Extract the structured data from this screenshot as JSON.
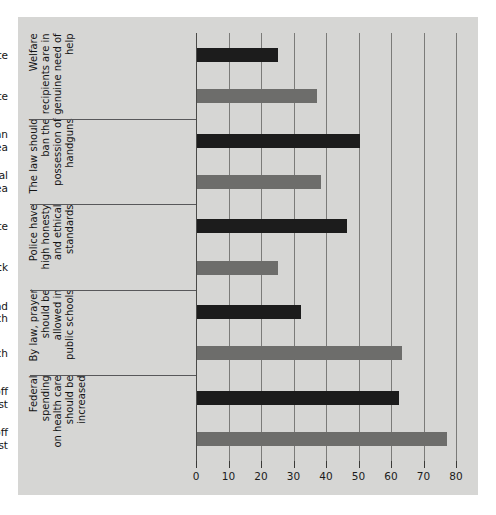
{
  "chart_data": {
    "type": "bar",
    "orientation": "horizontal",
    "title": "",
    "xlabel": "",
    "ylabel": "",
    "xlim": [
      0,
      80
    ],
    "xticks": [
      0,
      10,
      20,
      30,
      40,
      50,
      60,
      70,
      80
    ],
    "xticklabels": [
      "0",
      "10",
      "20",
      "30",
      "40",
      "50",
      "60",
      "70",
      "80"
    ],
    "grid": true,
    "grid_axis": "x",
    "legend": null,
    "colors": {
      "dark_bar": "#1c1c1c",
      "light_bar": "#6d6d6b",
      "panel_background": "#d6d6d4",
      "gridline": "#7b7b79",
      "separator": "#58585a",
      "text": "#141414"
    },
    "groups": [
      {
        "group_label": "Welfare\nrecipients are in\ngenuine need of\nhelp",
        "bars": [
          {
            "category": "Respondent is white",
            "value": 25,
            "style": "dark"
          },
          {
            "category": "Respondent is nonwhite",
            "value": 37,
            "style": "light"
          }
        ]
      },
      {
        "group_label": "The law should\nban the\npossession of\nhandguns",
        "bars": [
          {
            "category": "Respondent lives in an urban area",
            "value": 50,
            "style": "dark"
          },
          {
            "category": "Respondent lives in a rural area",
            "value": 38,
            "style": "light"
          }
        ]
      },
      {
        "group_label": "Police have\nhigh honesty\nand ethical\nstandards",
        "bars": [
          {
            "category": "Respondent is white",
            "value": 46,
            "style": "dark"
          },
          {
            "category": "Respondent is black",
            "value": 25,
            "style": "light"
          }
        ]
      },
      {
        "group_label": "By law, prayer\nshould be\nallowed in\npublic schools",
        "bars": [
          {
            "category": "Respondent does not attend church",
            "value": 32,
            "style": "dark"
          },
          {
            "category": "Respondent attends church",
            "value": 63,
            "style": "light"
          }
        ]
      },
      {
        "group_label": "Federal spending\non health care\nshould be\nincreased",
        "bars": [
          {
            "category": "Respondent has not put off medical care due to the cost",
            "value": 62,
            "style": "dark"
          },
          {
            "category": "Respondent has put off medical care due to the cost",
            "value": 77,
            "style": "light"
          }
        ]
      }
    ]
  }
}
